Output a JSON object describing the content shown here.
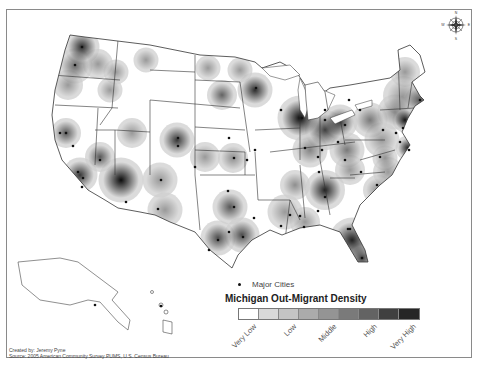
{
  "map": {
    "title": "Michigan Out-Migrant Density",
    "legend": {
      "cities_label": "Major Cities",
      "title": "Michigan Out-Migrant Density",
      "ramp_colors": [
        "#ffffff",
        "#d9d9d9",
        "#c4c4c4",
        "#ababab",
        "#949494",
        "#7a7a7a",
        "#636363",
        "#404040",
        "#262626"
      ],
      "ramp_labels": [
        {
          "text": "Very Low",
          "index": 0
        },
        {
          "text": "Low",
          "index": 2
        },
        {
          "text": "Middle",
          "index": 4
        },
        {
          "text": "High",
          "index": 6
        },
        {
          "text": "Very High",
          "index": 8
        }
      ]
    },
    "compass": {
      "n": "N",
      "s": "S",
      "e": "E",
      "w": "W"
    },
    "credits": {
      "created_by": "Created by: Jeremy Pyne",
      "source": "Source: 2005 American Community Survey PUMS, U.S. Census Bureau"
    },
    "colors": {
      "frame": "#8a8a8a",
      "border": "#333333",
      "city": "#111111"
    },
    "hotspots": [
      {
        "x": 82,
        "y": 47,
        "r": 14,
        "intensity": 0.8
      },
      {
        "x": 75,
        "y": 66,
        "r": 14,
        "intensity": 0.5
      },
      {
        "x": 98,
        "y": 64,
        "r": 12,
        "intensity": 0.3
      },
      {
        "x": 68,
        "y": 85,
        "r": 12,
        "intensity": 0.3
      },
      {
        "x": 116,
        "y": 72,
        "r": 10,
        "intensity": 0.3
      },
      {
        "x": 110,
        "y": 90,
        "r": 10,
        "intensity": 0.3
      },
      {
        "x": 146,
        "y": 60,
        "r": 10,
        "intensity": 0.3
      },
      {
        "x": 208,
        "y": 68,
        "r": 10,
        "intensity": 0.3
      },
      {
        "x": 222,
        "y": 95,
        "r": 12,
        "intensity": 0.55
      },
      {
        "x": 240,
        "y": 70,
        "r": 10,
        "intensity": 0.3
      },
      {
        "x": 255,
        "y": 90,
        "r": 14,
        "intensity": 0.8
      },
      {
        "x": 66,
        "y": 133,
        "r": 12,
        "intensity": 0.6
      },
      {
        "x": 100,
        "y": 157,
        "r": 12,
        "intensity": 0.6
      },
      {
        "x": 80,
        "y": 175,
        "r": 14,
        "intensity": 0.75
      },
      {
        "x": 132,
        "y": 133,
        "r": 12,
        "intensity": 0.3
      },
      {
        "x": 177,
        "y": 140,
        "r": 14,
        "intensity": 0.75
      },
      {
        "x": 121,
        "y": 180,
        "r": 18,
        "intensity": 0.95
      },
      {
        "x": 160,
        "y": 180,
        "r": 14,
        "intensity": 0.3
      },
      {
        "x": 165,
        "y": 210,
        "r": 14,
        "intensity": 0.3
      },
      {
        "x": 205,
        "y": 157,
        "r": 12,
        "intensity": 0.3
      },
      {
        "x": 233,
        "y": 158,
        "r": 12,
        "intensity": 0.35
      },
      {
        "x": 230,
        "y": 207,
        "r": 14,
        "intensity": 0.6
      },
      {
        "x": 218,
        "y": 238,
        "r": 14,
        "intensity": 0.65
      },
      {
        "x": 242,
        "y": 235,
        "r": 14,
        "intensity": 0.65
      },
      {
        "x": 285,
        "y": 212,
        "r": 14,
        "intensity": 0.3
      },
      {
        "x": 305,
        "y": 222,
        "r": 12,
        "intensity": 0.3
      },
      {
        "x": 295,
        "y": 185,
        "r": 12,
        "intensity": 0.35
      },
      {
        "x": 325,
        "y": 190,
        "r": 16,
        "intensity": 0.85
      },
      {
        "x": 352,
        "y": 240,
        "r": 18,
        "intensity": 0.85
      },
      {
        "x": 362,
        "y": 258,
        "r": 12,
        "intensity": 0.7
      },
      {
        "x": 300,
        "y": 118,
        "r": 18,
        "intensity": 0.95
      },
      {
        "x": 325,
        "y": 130,
        "r": 16,
        "intensity": 0.7
      },
      {
        "x": 340,
        "y": 122,
        "r": 14,
        "intensity": 0.7
      },
      {
        "x": 310,
        "y": 150,
        "r": 14,
        "intensity": 0.4
      },
      {
        "x": 347,
        "y": 150,
        "r": 14,
        "intensity": 0.45
      },
      {
        "x": 370,
        "y": 120,
        "r": 14,
        "intensity": 0.45
      },
      {
        "x": 395,
        "y": 112,
        "r": 14,
        "intensity": 0.35
      },
      {
        "x": 382,
        "y": 140,
        "r": 14,
        "intensity": 0.3
      },
      {
        "x": 388,
        "y": 172,
        "r": 12,
        "intensity": 0.3
      },
      {
        "x": 350,
        "y": 170,
        "r": 12,
        "intensity": 0.3
      },
      {
        "x": 378,
        "y": 190,
        "r": 12,
        "intensity": 0.35
      },
      {
        "x": 385,
        "y": 158,
        "r": 10,
        "intensity": 0.3
      },
      {
        "x": 405,
        "y": 120,
        "r": 10,
        "intensity": 0.9
      },
      {
        "x": 420,
        "y": 100,
        "r": 12,
        "intensity": 0.6
      },
      {
        "x": 408,
        "y": 148,
        "r": 10,
        "intensity": 0.85
      },
      {
        "x": 403,
        "y": 96,
        "r": 16,
        "intensity": 0.3
      },
      {
        "x": 405,
        "y": 72,
        "r": 12,
        "intensity": 0.3
      },
      {
        "x": 445,
        "y": 60,
        "r": 10,
        "intensity": 0.3
      }
    ],
    "cities": [
      {
        "x": 82,
        "y": 47
      },
      {
        "x": 75,
        "y": 65
      },
      {
        "x": 60,
        "y": 133
      },
      {
        "x": 66,
        "y": 133
      },
      {
        "x": 73,
        "y": 146
      },
      {
        "x": 100,
        "y": 160
      },
      {
        "x": 78,
        "y": 172
      },
      {
        "x": 83,
        "y": 178
      },
      {
        "x": 82,
        "y": 187
      },
      {
        "x": 126,
        "y": 202
      },
      {
        "x": 161,
        "y": 180
      },
      {
        "x": 158,
        "y": 209
      },
      {
        "x": 178,
        "y": 138
      },
      {
        "x": 178,
        "y": 146
      },
      {
        "x": 195,
        "y": 167
      },
      {
        "x": 229,
        "y": 138
      },
      {
        "x": 234,
        "y": 158
      },
      {
        "x": 228,
        "y": 191
      },
      {
        "x": 234,
        "y": 207
      },
      {
        "x": 229,
        "y": 232
      },
      {
        "x": 218,
        "y": 240
      },
      {
        "x": 243,
        "y": 237
      },
      {
        "x": 209,
        "y": 250
      },
      {
        "x": 254,
        "y": 218
      },
      {
        "x": 247,
        "y": 160
      },
      {
        "x": 255,
        "y": 150
      },
      {
        "x": 256,
        "y": 88
      },
      {
        "x": 281,
        "y": 110
      },
      {
        "x": 302,
        "y": 118
      },
      {
        "x": 325,
        "y": 120
      },
      {
        "x": 345,
        "y": 125
      },
      {
        "x": 338,
        "y": 142
      },
      {
        "x": 290,
        "y": 215
      },
      {
        "x": 281,
        "y": 226
      },
      {
        "x": 300,
        "y": 216
      },
      {
        "x": 304,
        "y": 227
      },
      {
        "x": 318,
        "y": 211
      },
      {
        "x": 325,
        "y": 197
      },
      {
        "x": 319,
        "y": 172
      },
      {
        "x": 305,
        "y": 148
      },
      {
        "x": 322,
        "y": 150
      },
      {
        "x": 318,
        "y": 157
      },
      {
        "x": 345,
        "y": 160
      },
      {
        "x": 361,
        "y": 172
      },
      {
        "x": 380,
        "y": 157
      },
      {
        "x": 377,
        "y": 185
      },
      {
        "x": 350,
        "y": 229
      },
      {
        "x": 362,
        "y": 258
      },
      {
        "x": 348,
        "y": 229
      },
      {
        "x": 349,
        "y": 100
      },
      {
        "x": 360,
        "y": 110
      },
      {
        "x": 383,
        "y": 130
      },
      {
        "x": 396,
        "y": 133
      },
      {
        "x": 403,
        "y": 128
      },
      {
        "x": 400,
        "y": 142
      },
      {
        "x": 409,
        "y": 150
      },
      {
        "x": 420,
        "y": 100
      },
      {
        "x": 325,
        "y": 110
      },
      {
        "x": 95,
        "y": 305
      },
      {
        "x": 161,
        "y": 306
      }
    ]
  }
}
